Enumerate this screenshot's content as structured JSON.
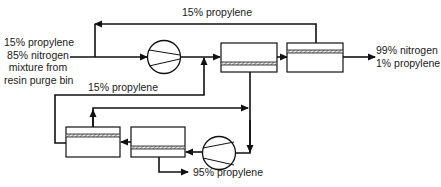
{
  "diagram": {
    "type": "process-flow",
    "feed_label": {
      "lines": [
        "15% propylene",
        "85% nitrogen",
        "mixture from",
        "resin purge bin"
      ]
    },
    "top_recycle_label": "15% propylene",
    "lower_recycle_label": "15% propylene",
    "product_nitrogen_label": {
      "lines": [
        "99% nitrogen",
        "1% propylene"
      ]
    },
    "product_propylene_label": "95% propylene",
    "nodes": [
      {
        "id": "compressor-1",
        "kind": "compressor"
      },
      {
        "id": "membrane-1",
        "kind": "membrane-module"
      },
      {
        "id": "membrane-2",
        "kind": "membrane-module"
      },
      {
        "id": "compressor-2",
        "kind": "compressor"
      },
      {
        "id": "membrane-4",
        "kind": "membrane-module"
      },
      {
        "id": "membrane-3",
        "kind": "membrane-module"
      }
    ],
    "colors": {
      "line": "#111111",
      "hatch": "#777777",
      "background": "#ffffff"
    }
  }
}
